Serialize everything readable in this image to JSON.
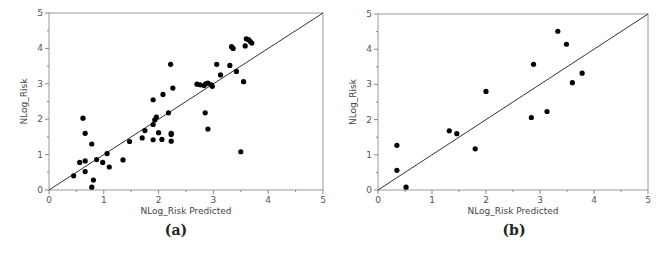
{
  "chart_data": [
    {
      "panel": "a",
      "caption": "(a)",
      "type": "scatter",
      "title": "",
      "xlabel": "NLog_Risk Predicted",
      "ylabel": "NLog_Risk",
      "xlim": [
        0,
        5
      ],
      "ylim": [
        0,
        5
      ],
      "xticks": [
        "0",
        "1",
        "2",
        "3",
        "4",
        "5"
      ],
      "yticks": [
        "0",
        "1",
        "2",
        "3",
        "4",
        "5"
      ],
      "grid": false,
      "reference_line": "y = x",
      "points": [
        [
          0.45,
          0.4
        ],
        [
          0.56,
          0.78
        ],
        [
          0.62,
          2.03
        ],
        [
          0.66,
          1.6
        ],
        [
          0.66,
          0.82
        ],
        [
          0.66,
          0.52
        ],
        [
          0.78,
          1.3
        ],
        [
          0.78,
          0.08
        ],
        [
          0.81,
          0.28
        ],
        [
          0.87,
          0.86
        ],
        [
          0.98,
          0.78
        ],
        [
          1.06,
          1.03
        ],
        [
          1.1,
          0.65
        ],
        [
          1.35,
          0.85
        ],
        [
          1.47,
          1.37
        ],
        [
          1.7,
          1.47
        ],
        [
          1.75,
          1.68
        ],
        [
          1.9,
          1.85
        ],
        [
          1.9,
          2.55
        ],
        [
          1.9,
          1.42
        ],
        [
          1.93,
          1.98
        ],
        [
          1.96,
          2.06
        ],
        [
          2.0,
          1.62
        ],
        [
          2.06,
          1.43
        ],
        [
          2.08,
          2.7
        ],
        [
          2.18,
          2.18
        ],
        [
          2.22,
          3.55
        ],
        [
          2.23,
          1.6
        ],
        [
          2.23,
          1.57
        ],
        [
          2.23,
          1.38
        ],
        [
          2.26,
          2.88
        ],
        [
          2.7,
          2.99
        ],
        [
          2.76,
          2.97
        ],
        [
          2.83,
          2.95
        ],
        [
          2.85,
          2.18
        ],
        [
          2.86,
          3.0
        ],
        [
          2.9,
          3.02
        ],
        [
          2.9,
          1.72
        ],
        [
          2.96,
          2.97
        ],
        [
          2.98,
          2.93
        ],
        [
          3.06,
          3.55
        ],
        [
          3.13,
          3.25
        ],
        [
          3.3,
          3.52
        ],
        [
          3.33,
          4.05
        ],
        [
          3.36,
          4.0
        ],
        [
          3.42,
          3.35
        ],
        [
          3.5,
          1.08
        ],
        [
          3.55,
          3.06
        ],
        [
          3.58,
          4.07
        ],
        [
          3.6,
          4.27
        ],
        [
          3.64,
          4.25
        ],
        [
          3.67,
          4.2
        ],
        [
          3.7,
          4.15
        ]
      ]
    },
    {
      "panel": "b",
      "caption": "(b)",
      "type": "scatter",
      "title": "",
      "xlabel": "NLog_Risk Predicted",
      "ylabel": "NLog_Risk",
      "xlim": [
        0,
        5
      ],
      "ylim": [
        0,
        5
      ],
      "xticks": [
        "0",
        "1",
        "2",
        "3",
        "4",
        "5"
      ],
      "yticks": [
        "0",
        "1",
        "2",
        "3",
        "4",
        "5"
      ],
      "grid": false,
      "reference_line": "y = x",
      "points": [
        [
          0.35,
          1.27
        ],
        [
          0.35,
          0.56
        ],
        [
          0.52,
          0.08
        ],
        [
          1.32,
          1.68
        ],
        [
          1.46,
          1.6
        ],
        [
          1.8,
          1.17
        ],
        [
          2.0,
          2.8
        ],
        [
          2.84,
          2.06
        ],
        [
          2.88,
          3.57
        ],
        [
          3.13,
          2.23
        ],
        [
          3.33,
          4.51
        ],
        [
          3.49,
          4.14
        ],
        [
          3.6,
          3.05
        ],
        [
          3.78,
          3.32
        ]
      ]
    }
  ],
  "captions": {
    "a": "(a)",
    "b": "(b)"
  },
  "axis_labels": {
    "x": "NLog_Risk Predicted",
    "y": "NLog_Risk"
  }
}
